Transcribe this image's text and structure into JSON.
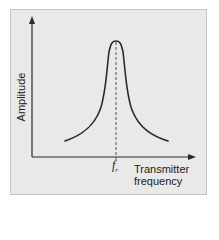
{
  "diagram": {
    "type": "resonance-curve",
    "y_axis_label": "Amplitude",
    "x_axis_label_line1": "Transmitter",
    "x_axis_label_line2": "frequency",
    "peak_marker_symbol": "f",
    "peak_marker_subscript": "r",
    "colors": {
      "panel_background": "#e9e9e9",
      "panel_border": "#c4c4c4",
      "line": "#2a2a2a"
    }
  }
}
